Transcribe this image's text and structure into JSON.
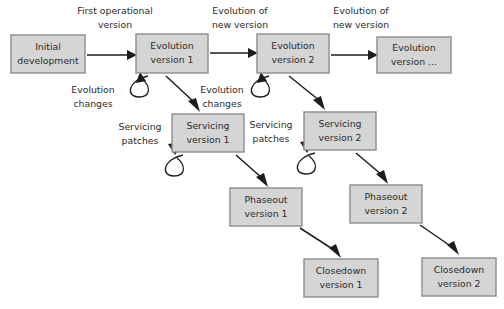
{
  "diagram": {
    "type": "flowchart",
    "canvas": {
      "width": 504,
      "height": 309,
      "background": "#ffffff"
    },
    "style": {
      "box_fill": "#d5d5d5",
      "box_stroke": "#8c8c8c",
      "text_color": "#2b2b2b",
      "arrow_color": "#1d1d1d"
    },
    "nodes": [
      {
        "id": "initial-development",
        "line1": "Initial",
        "line2": "development",
        "x": 11,
        "y": 35,
        "w": 74,
        "h": 38
      },
      {
        "id": "evolution-version-1",
        "line1": "Evolution",
        "line2": "version 1",
        "x": 136,
        "y": 34,
        "w": 72,
        "h": 39
      },
      {
        "id": "evolution-version-2",
        "line1": "Evolution",
        "line2": "version 2",
        "x": 257,
        "y": 34,
        "w": 72,
        "h": 39
      },
      {
        "id": "evolution-version-n",
        "line1": "Evolution",
        "line2": "version ...",
        "x": 377,
        "y": 37,
        "w": 74,
        "h": 36
      },
      {
        "id": "servicing-version-1",
        "line1": "Servicing",
        "line2": "version 1",
        "x": 172,
        "y": 114,
        "w": 72,
        "h": 38
      },
      {
        "id": "servicing-version-2",
        "line1": "Servicing",
        "line2": "version 2",
        "x": 304,
        "y": 112,
        "w": 72,
        "h": 38
      },
      {
        "id": "phaseout-version-1",
        "line1": "Phaseout",
        "line2": "version 1",
        "x": 230,
        "y": 188,
        "w": 72,
        "h": 38
      },
      {
        "id": "phaseout-version-2",
        "line1": "Phaseout",
        "line2": "version 2",
        "x": 350,
        "y": 185,
        "w": 72,
        "h": 38
      },
      {
        "id": "closedown-version-1",
        "line1": "Closedown",
        "line2": "version 1",
        "x": 304,
        "y": 259,
        "w": 74,
        "h": 38
      },
      {
        "id": "closedown-version-2",
        "line1": "Closedown",
        "line2": "version 2",
        "x": 422,
        "y": 258,
        "w": 74,
        "h": 38
      }
    ],
    "edge_labels": [
      {
        "id": "first-operational-version",
        "line1": "First operational",
        "line2": "version",
        "cx": 115,
        "cy": 10
      },
      {
        "id": "evolution-of-new-version-1",
        "line1": "Evolution of",
        "line2": "new version",
        "cx": 240,
        "cy": 10
      },
      {
        "id": "evolution-of-new-version-2",
        "line1": "Evolution of",
        "line2": "new version",
        "cx": 361,
        "cy": 10
      },
      {
        "id": "evolution-changes-1",
        "line1": "Evolution",
        "line2": "changes",
        "cx": 93,
        "cy": 90
      },
      {
        "id": "evolution-changes-2",
        "line1": "Evolution",
        "line2": "changes",
        "cx": 222,
        "cy": 90
      },
      {
        "id": "servicing-patches-1",
        "line1": "Servicing",
        "line2": "patches",
        "cx": 140,
        "cy": 127
      },
      {
        "id": "servicing-patches-2",
        "line1": "Servicing",
        "line2": "patches",
        "cx": 271,
        "cy": 125
      }
    ],
    "connections": [
      {
        "from": "initial-development",
        "to": "evolution-version-1",
        "label": "first-operational-version"
      },
      {
        "from": "evolution-version-1",
        "to": "evolution-version-2",
        "label": "evolution-of-new-version-1"
      },
      {
        "from": "evolution-version-2",
        "to": "evolution-version-n",
        "label": "evolution-of-new-version-2"
      },
      {
        "from": "evolution-version-1",
        "to": "evolution-version-1",
        "label": "evolution-changes-1",
        "kind": "self-loop"
      },
      {
        "from": "evolution-version-2",
        "to": "evolution-version-2",
        "label": "evolution-changes-2",
        "kind": "self-loop"
      },
      {
        "from": "evolution-version-1",
        "to": "servicing-version-1",
        "label": ""
      },
      {
        "from": "evolution-version-2",
        "to": "servicing-version-2",
        "label": ""
      },
      {
        "from": "servicing-version-1",
        "to": "servicing-version-1",
        "label": "servicing-patches-1",
        "kind": "self-loop"
      },
      {
        "from": "servicing-version-2",
        "to": "servicing-version-2",
        "label": "servicing-patches-2",
        "kind": "self-loop"
      },
      {
        "from": "servicing-version-1",
        "to": "phaseout-version-1",
        "label": ""
      },
      {
        "from": "servicing-version-2",
        "to": "phaseout-version-2",
        "label": ""
      },
      {
        "from": "phaseout-version-1",
        "to": "closedown-version-1",
        "label": ""
      },
      {
        "from": "phaseout-version-2",
        "to": "closedown-version-2",
        "label": ""
      }
    ]
  }
}
